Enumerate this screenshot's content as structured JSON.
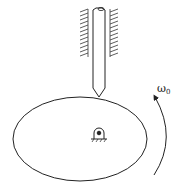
{
  "diagram": {
    "title": "",
    "components": {
      "cam": {
        "shape": "ellipse",
        "name": "elliptical cam"
      },
      "follower": {
        "shape": "pointed rod",
        "name": "knife-edge follower"
      },
      "guides": {
        "name": "fixed guide bearings (hatched)"
      },
      "pivot": {
        "name": "fixed pivot support"
      }
    },
    "rotation": {
      "symbol": "ω",
      "subscript": "0",
      "direction": "counter-clockwise"
    },
    "colors": {
      "stroke": "#222222",
      "background": "#ffffff"
    }
  }
}
